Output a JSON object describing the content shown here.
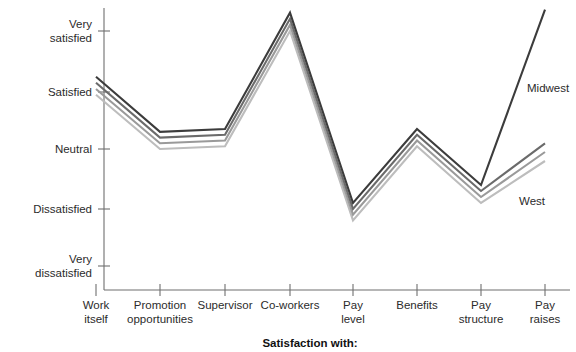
{
  "chart_data": {
    "type": "line",
    "title": "",
    "xlabel": "Satisfaction with:",
    "ylabel": "",
    "grid": false,
    "legend_position": "inline-right",
    "categories": [
      "Work itself",
      "Promotion opportunities",
      "Supervisor",
      "Co-workers",
      "Pay level",
      "Benefits",
      "Pay structure",
      "Pay raises"
    ],
    "category_lines": [
      [
        "Work",
        "itself"
      ],
      [
        "Promotion",
        "opportunities"
      ],
      [
        "Supervisor",
        ""
      ],
      [
        "Co-workers",
        ""
      ],
      [
        "Pay",
        "level"
      ],
      [
        "Benefits",
        ""
      ],
      [
        "Pay",
        "structure"
      ],
      [
        "Pay",
        "raises"
      ]
    ],
    "y_tick_labels": [
      [
        "Very",
        "satisfied"
      ],
      [
        "Satisfied",
        ""
      ],
      [
        "Neutral",
        ""
      ],
      [
        "Dissatisfied",
        ""
      ],
      [
        "Very",
        "dissatisfied"
      ]
    ],
    "y_tick_values": [
      5,
      4,
      3,
      2,
      1
    ],
    "ylim": [
      0.7,
      5.4
    ],
    "series": [
      {
        "name": "Midwest",
        "color": "#3c3c3c",
        "values": [
          4.25,
          3.3,
          3.35,
          5.3,
          2.1,
          3.35,
          2.4,
          5.35
        ]
      },
      {
        "name": "Series 2",
        "color": "#6b6b6b",
        "values": [
          4.15,
          3.2,
          3.25,
          5.2,
          2.0,
          3.25,
          2.3,
          3.1
        ]
      },
      {
        "name": "Series 3",
        "color": "#9a9a9a",
        "values": [
          4.05,
          3.1,
          3.15,
          5.1,
          1.9,
          3.15,
          2.2,
          2.95
        ]
      },
      {
        "name": "West",
        "color": "#bdbdbd",
        "values": [
          3.95,
          3.0,
          3.05,
          5.0,
          1.8,
          3.05,
          2.1,
          2.8
        ]
      }
    ],
    "annotations": [
      {
        "text": "Midwest",
        "x": 527,
        "y": 92
      },
      {
        "text": "West",
        "x": 519,
        "y": 205
      }
    ]
  }
}
